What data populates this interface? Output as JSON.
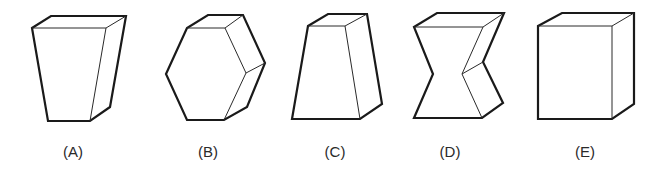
{
  "figure": {
    "options": [
      {
        "id": "A",
        "label": "(A)",
        "shape": "tapered-block-narrow-bottom"
      },
      {
        "id": "B",
        "label": "(B)",
        "shape": "hexagonal-prism"
      },
      {
        "id": "C",
        "label": "(C)",
        "shape": "tapered-block-narrow-top"
      },
      {
        "id": "D",
        "label": "(D)",
        "shape": "notched-hourglass-prism"
      },
      {
        "id": "E",
        "label": "(E)",
        "shape": "rectangular-box"
      }
    ],
    "colors": {
      "stroke": "#1a1a1a",
      "fill": "#ffffff",
      "label": "#2a2a2a"
    }
  }
}
